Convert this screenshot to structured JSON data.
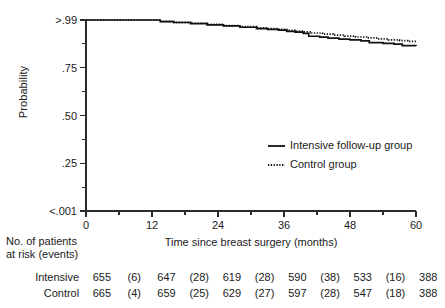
{
  "chart_data": {
    "type": "line",
    "title": "",
    "subtitle": "",
    "xlabel": "Time since breast surgery (months)",
    "ylabel": "Probability",
    "xlim": [
      0,
      60
    ],
    "ylim": [
      0,
      1
    ],
    "grid": false,
    "legend_position": "inside-right",
    "x_ticks": [
      {
        "value": 0,
        "label": "0",
        "major": true
      },
      {
        "value": 6,
        "label": "",
        "major": false
      },
      {
        "value": 12,
        "label": "12",
        "major": true
      },
      {
        "value": 18,
        "label": "",
        "major": false
      },
      {
        "value": 24,
        "label": "24",
        "major": true
      },
      {
        "value": 30,
        "label": "",
        "major": false
      },
      {
        "value": 36,
        "label": "36",
        "major": true
      },
      {
        "value": 42,
        "label": "",
        "major": false
      },
      {
        "value": 48,
        "label": "48",
        "major": true
      },
      {
        "value": 54,
        "label": "",
        "major": false
      },
      {
        "value": 60,
        "label": "60",
        "major": true
      }
    ],
    "y_ticks": [
      {
        "value": 1.0,
        "label": ">.99",
        "major": true
      },
      {
        "value": 0.875,
        "label": "",
        "major": false
      },
      {
        "value": 0.75,
        "label": ".75",
        "major": true
      },
      {
        "value": 0.625,
        "label": "",
        "major": false
      },
      {
        "value": 0.5,
        "label": ".50",
        "major": true
      },
      {
        "value": 0.375,
        "label": "",
        "major": false
      },
      {
        "value": 0.25,
        "label": ".25",
        "major": true
      },
      {
        "value": 0.125,
        "label": "",
        "major": false
      },
      {
        "value": 0.0,
        "label": "<.001",
        "major": true
      }
    ],
    "series": [
      {
        "name": "Intensive follow-up group",
        "style": "solid",
        "color": "#111111",
        "points": [
          [
            0,
            1.0
          ],
          [
            12,
            1.0
          ],
          [
            13.5,
            0.992
          ],
          [
            16,
            0.987
          ],
          [
            19,
            0.981
          ],
          [
            22,
            0.975
          ],
          [
            25,
            0.969
          ],
          [
            28,
            0.962
          ],
          [
            31,
            0.955
          ],
          [
            33,
            0.951
          ],
          [
            35,
            0.947
          ],
          [
            36.5,
            0.94
          ],
          [
            38,
            0.936
          ],
          [
            39.5,
            0.93
          ],
          [
            40.5,
            0.915
          ],
          [
            42.5,
            0.91
          ],
          [
            44,
            0.905
          ],
          [
            46,
            0.9
          ],
          [
            48,
            0.896
          ],
          [
            50,
            0.891
          ],
          [
            51.5,
            0.882
          ],
          [
            54,
            0.878
          ],
          [
            56,
            0.874
          ],
          [
            57.5,
            0.866
          ],
          [
            60,
            0.864
          ]
        ]
      },
      {
        "name": "Control group",
        "style": "dotted",
        "color": "#111111",
        "points": [
          [
            0,
            1.0
          ],
          [
            12,
            1.0
          ],
          [
            13.5,
            0.993
          ],
          [
            16,
            0.988
          ],
          [
            19,
            0.983
          ],
          [
            22,
            0.977
          ],
          [
            25,
            0.971
          ],
          [
            28,
            0.965
          ],
          [
            31,
            0.959
          ],
          [
            33,
            0.955
          ],
          [
            35,
            0.951
          ],
          [
            36.5,
            0.946
          ],
          [
            38,
            0.942
          ],
          [
            39.5,
            0.938
          ],
          [
            41,
            0.932
          ],
          [
            43,
            0.926
          ],
          [
            45,
            0.921
          ],
          [
            47,
            0.916
          ],
          [
            49,
            0.911
          ],
          [
            51,
            0.906
          ],
          [
            53,
            0.901
          ],
          [
            55,
            0.896
          ],
          [
            57,
            0.892
          ],
          [
            58.5,
            0.888
          ],
          [
            60,
            0.886
          ]
        ]
      }
    ]
  },
  "legend": {
    "items": [
      {
        "label": "Intensive follow-up group",
        "style": "solid"
      },
      {
        "label": "Control group",
        "style": "dotted"
      }
    ]
  },
  "risk_table": {
    "heading_line1": "No. of patients",
    "heading_line2": "at risk (events)",
    "rows": [
      {
        "label": "Intensive",
        "cells": [
          "655",
          "(6)",
          "647",
          "(28)",
          "619",
          "(28)",
          "590",
          "(38)",
          "533",
          "(16)",
          "388"
        ]
      },
      {
        "label": "Control",
        "cells": [
          "665",
          "(4)",
          "659",
          "(25)",
          "629",
          "(27)",
          "597",
          "(28)",
          "547",
          "(18)",
          "388"
        ]
      }
    ]
  },
  "colors": {
    "background": "#ffffff",
    "ink": "#1a1a1a",
    "curve": "#111111",
    "axis": "#2b2b2b"
  }
}
